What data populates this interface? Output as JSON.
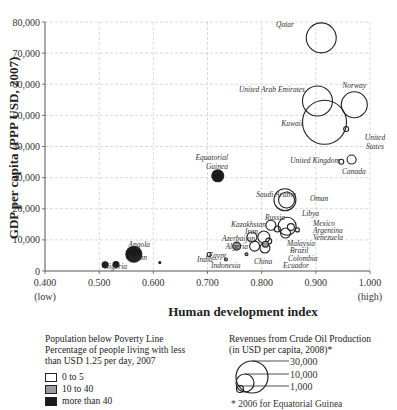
{
  "chart_data": {
    "type": "scatter",
    "title": "",
    "xlabel": "Human development index",
    "ylabel": "GDP per capita (PPP USD, 2007)",
    "xlim": [
      0.4,
      1.0
    ],
    "ylim": [
      0,
      80000
    ],
    "grid": true,
    "x_ticks": [
      "0.400",
      "0.500",
      "0.600",
      "0.700",
      "0.800",
      "0.900",
      "1.000"
    ],
    "x_tick_sublabels": {
      "0.400": "(low)",
      "1.000": "(high)"
    },
    "y_ticks": [
      "0",
      "10,000",
      "20,000",
      "30,000",
      "40,000",
      "50,000",
      "60,000",
      "70,000",
      "80,000"
    ],
    "size_encoding": "Revenues from Crude Oil Production (USD per capita, 2008)",
    "color_encoding": "Population below poverty line (%)",
    "points": [
      {
        "name": "Qatar",
        "hdi": 0.91,
        "gdp": 74900,
        "r": 15,
        "poverty": "0 to 5"
      },
      {
        "name": "United Arab Emirates",
        "hdi": 0.903,
        "gdp": 54600,
        "r": 15,
        "poverty": "0 to 5"
      },
      {
        "name": "Norway",
        "hdi": 0.971,
        "gdp": 53400,
        "r": 13,
        "poverty": "0 to 5"
      },
      {
        "name": "Kuwait",
        "hdi": 0.916,
        "gdp": 47800,
        "r": 22,
        "poverty": "0 to 5"
      },
      {
        "name": "United States",
        "hdi": 0.956,
        "gdp": 45600,
        "r": 2.5,
        "poverty": "0 to 5"
      },
      {
        "name": "United Kingdom",
        "hdi": 0.947,
        "gdp": 35100,
        "r": 2.5,
        "poverty": "0 to 5"
      },
      {
        "name": "Canada",
        "hdi": 0.966,
        "gdp": 35800,
        "r": 4.5,
        "poverty": "0 to 5"
      },
      {
        "name": "Equatorial Guinea",
        "hdi": 0.719,
        "gdp": 30600,
        "r": 6,
        "poverty": "more than 40"
      },
      {
        "name": "Saudi Arabia",
        "hdi": 0.843,
        "gdp": 22900,
        "r": 11,
        "poverty": "0 to 5"
      },
      {
        "name": "Oman",
        "hdi": 0.846,
        "gdp": 22800,
        "r": 8,
        "poverty": "0 to 5"
      },
      {
        "name": "Libya",
        "hdi": 0.847,
        "gdp": 14400,
        "r": 9,
        "poverty": "0 to 5"
      },
      {
        "name": "Russia",
        "hdi": 0.817,
        "gdp": 14700,
        "r": 5,
        "poverty": "0 to 5"
      },
      {
        "name": "Mexico",
        "hdi": 0.854,
        "gdp": 14100,
        "r": 3.5,
        "poverty": "0 to 5"
      },
      {
        "name": "Argentina",
        "hdi": 0.866,
        "gdp": 13200,
        "r": 2,
        "poverty": "0 to 5"
      },
      {
        "name": "Venezuela",
        "hdi": 0.844,
        "gdp": 12200,
        "r": 5,
        "poverty": "0 to 5"
      },
      {
        "name": "Kazakhstan",
        "hdi": 0.804,
        "gdp": 10900,
        "r": 6,
        "poverty": "0 to 5"
      },
      {
        "name": "Iran",
        "hdi": 0.782,
        "gdp": 10900,
        "r": 5,
        "poverty": "0 to 5"
      },
      {
        "name": "Malaysia",
        "hdi": 0.829,
        "gdp": 13500,
        "r": 3,
        "poverty": "0 to 5"
      },
      {
        "name": "Azerbaijan",
        "hdi": 0.787,
        "gdp": 8000,
        "r": 5,
        "poverty": "0 to 5"
      },
      {
        "name": "Brazil",
        "hdi": 0.813,
        "gdp": 9600,
        "r": 3,
        "poverty": "0 to 5"
      },
      {
        "name": "Colombia",
        "hdi": 0.807,
        "gdp": 8600,
        "r": 3,
        "poverty": "10 to 40"
      },
      {
        "name": "Ecuador",
        "hdi": 0.806,
        "gdp": 7400,
        "r": 5,
        "poverty": "0 to 5"
      },
      {
        "name": "Algeria",
        "hdi": 0.754,
        "gdp": 8000,
        "r": 4,
        "poverty": "10 to 40"
      },
      {
        "name": "China",
        "hdi": 0.772,
        "gdp": 5400,
        "r": 1.5,
        "poverty": "10 to 40"
      },
      {
        "name": "Egypt",
        "hdi": 0.703,
        "gdp": 5300,
        "r": 2,
        "poverty": "0 to 5"
      },
      {
        "name": "Indonesia",
        "hdi": 0.734,
        "gdp": 3700,
        "r": 1.5,
        "poverty": "10 to 40"
      },
      {
        "name": "India",
        "hdi": 0.612,
        "gdp": 2700,
        "r": 1,
        "poverty": "more than 40"
      },
      {
        "name": "Angola",
        "hdi": 0.564,
        "gdp": 5400,
        "r": 8,
        "poverty": "more than 40"
      },
      {
        "name": "Sudan",
        "hdi": 0.531,
        "gdp": 2100,
        "r": 3,
        "poverty": "more than 40"
      },
      {
        "name": "Nigeria",
        "hdi": 0.511,
        "gdp": 2000,
        "r": 3,
        "poverty": "more than 40"
      }
    ]
  },
  "legend": {
    "poverty": {
      "title_line1": "Population below Poverty Line",
      "title_line2": "Percentage of people living with less",
      "title_line3": "than USD 1.25 per day, 2007",
      "items": [
        {
          "label": "0 to 5",
          "color": "#ffffff"
        },
        {
          "label": "10 to 40",
          "color": "#9a9a9a"
        },
        {
          "label": "more than 40",
          "color": "#1a1a1a"
        }
      ]
    },
    "revenue": {
      "title_line1": "Revenues from Crude Oil Production",
      "title_line2": "(in USD per capita, 2008)*",
      "sizes": [
        "30,000",
        "10,000",
        "1,000"
      ],
      "footnote": "* 2006 for Equatorial Guinea"
    }
  }
}
